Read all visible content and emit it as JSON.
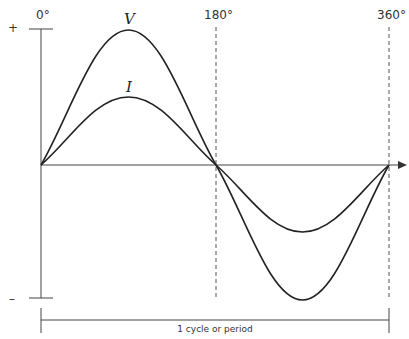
{
  "diagram": {
    "axis_labels": {
      "plus": "+",
      "minus": "–",
      "deg_0": "0°",
      "deg_180": "180°",
      "deg_360": "360°"
    },
    "curves": [
      {
        "name": "V",
        "label": "V",
        "amplitude_px": 135
      },
      {
        "name": "I",
        "label": "I",
        "amplitude_px": 68
      }
    ],
    "period_label": "1 cycle or period",
    "colors": {
      "line": "#222222",
      "axis": "#444444",
      "dashed": "#555555"
    }
  }
}
